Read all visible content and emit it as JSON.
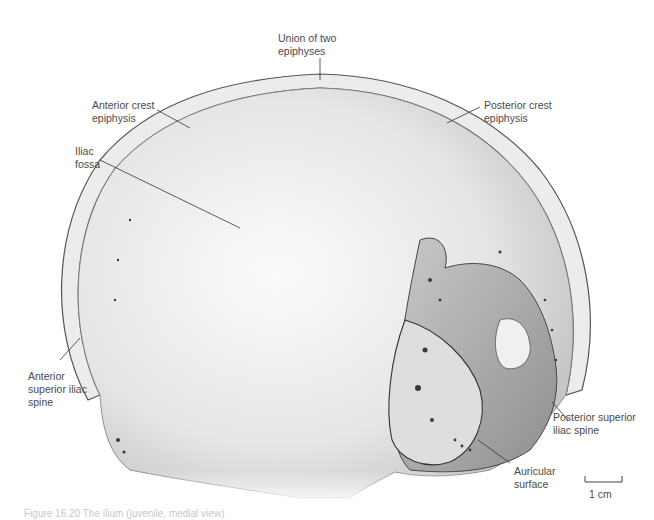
{
  "figure": {
    "labels": {
      "union": "Union of two\nepiphyses",
      "anterior_crest": "Anterior crest\nepiphysis",
      "posterior_crest": "Posterior crest\nepiphysis",
      "iliac_fossa": "Iliac\nfossa",
      "asis": "Anterior\nsuperior iliac\nspine",
      "psis": "Posterior superior\niliac spine",
      "auricular": "Auricular\nsurface"
    },
    "scale_bar": {
      "label": "1 cm"
    },
    "caption": "Figure 16.20  The ilium (juvenile, medial view)"
  },
  "colors": {
    "background": "#ffffff",
    "bone_light": "#f2f2f2",
    "bone_mid": "#cfcfcf",
    "bone_dark": "#8a8a8a",
    "outline": "#555555",
    "leader": "#333333",
    "text": "#4a4a4a"
  }
}
